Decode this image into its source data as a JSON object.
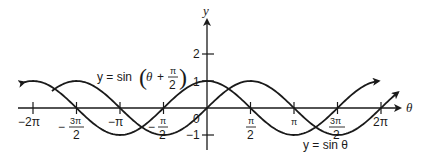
{
  "chart_data": {
    "type": "line",
    "title": "",
    "xlabel": "θ",
    "ylabel": "y",
    "xlim": [
      -6.6,
      7.0
    ],
    "ylim": [
      -1.2,
      2.5
    ],
    "grid": false,
    "x_ticks": [
      "-2π",
      "-3π/2",
      "-π",
      "-π/2",
      "π/2",
      "π",
      "3π/2",
      "2π"
    ],
    "y_ticks": [
      "2",
      "1",
      "-1"
    ],
    "origin_label": "0",
    "series": [
      {
        "name": "y = sin θ",
        "function": "sin(θ)",
        "x_range": [
          -5.6,
          6.9
        ],
        "x": [
          -4.712,
          -3.1416,
          -1.5708,
          0,
          1.5708,
          3.1416,
          4.712,
          6.2832
        ],
        "values": [
          1,
          0,
          -1,
          0,
          1,
          0,
          -1,
          0
        ]
      },
      {
        "name": "y = sin (θ + π/2)",
        "function": "sin(θ + π/2)",
        "x_range": [
          -6.6,
          6.2
        ],
        "x": [
          -6.2832,
          -4.712,
          -3.1416,
          -1.5708,
          0,
          1.5708,
          3.1416,
          4.712
        ],
        "values": [
          1,
          0,
          -1,
          0,
          1,
          0,
          -1,
          0
        ]
      }
    ],
    "annotations": [
      {
        "text": "y = sin (θ + π/2)",
        "position": "upper-left of y-axis"
      },
      {
        "text": "y = sin θ",
        "position": "lower-right near 3π/2"
      }
    ]
  },
  "labels": {
    "y_axis": "y",
    "x_axis": "θ",
    "origin": "0",
    "y2": "2",
    "y1": "1",
    "yneg1": "−1",
    "neg2pi": "−2π",
    "negpi": "−π",
    "pi": "π",
    "twopi": "2π",
    "neg_sign": "−",
    "three_pi": "3π",
    "pi_sym": "π",
    "two": "2",
    "curve1_label": "y = sin θ",
    "curve2_prefix": "y = sin",
    "theta": "θ",
    "plus": "+"
  }
}
